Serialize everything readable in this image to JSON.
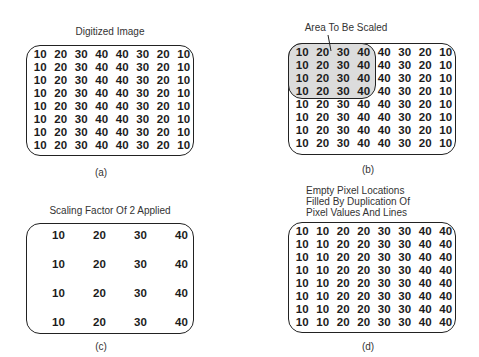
{
  "panels": {
    "a": {
      "title": "Digitized Image",
      "caption": "(a)",
      "grid": [
        [
          "10",
          "20",
          "30",
          "40",
          "40",
          "30",
          "20",
          "10"
        ],
        [
          "10",
          "20",
          "30",
          "40",
          "40",
          "30",
          "20",
          "10"
        ],
        [
          "10",
          "20",
          "30",
          "40",
          "40",
          "30",
          "20",
          "10"
        ],
        [
          "10",
          "20",
          "30",
          "40",
          "40",
          "30",
          "20",
          "10"
        ],
        [
          "10",
          "20",
          "30",
          "40",
          "40",
          "30",
          "20",
          "10"
        ],
        [
          "10",
          "20",
          "30",
          "40",
          "40",
          "30",
          "20",
          "10"
        ],
        [
          "10",
          "20",
          "30",
          "40",
          "40",
          "30",
          "20",
          "10"
        ],
        [
          "10",
          "20",
          "30",
          "40",
          "40",
          "30",
          "20",
          "10"
        ]
      ]
    },
    "b": {
      "title": "Area To Be Scaled",
      "caption": "(b)",
      "highlight": {
        "rows": 4,
        "cols": 4,
        "fill": "#dcdcdc"
      },
      "grid": [
        [
          "10",
          "20",
          "30",
          "40",
          "40",
          "30",
          "20",
          "10"
        ],
        [
          "10",
          "20",
          "30",
          "40",
          "40",
          "30",
          "20",
          "10"
        ],
        [
          "10",
          "20",
          "30",
          "40",
          "40",
          "30",
          "20",
          "10"
        ],
        [
          "10",
          "20",
          "30",
          "40",
          "40",
          "30",
          "20",
          "10"
        ],
        [
          "10",
          "20",
          "30",
          "40",
          "40",
          "30",
          "20",
          "10"
        ],
        [
          "10",
          "20",
          "30",
          "40",
          "40",
          "30",
          "20",
          "10"
        ],
        [
          "10",
          "20",
          "30",
          "40",
          "40",
          "30",
          "20",
          "10"
        ],
        [
          "10",
          "20",
          "30",
          "40",
          "40",
          "30",
          "20",
          "10"
        ]
      ]
    },
    "c": {
      "title": "Scaling Factor Of 2 Applied",
      "caption": "(c)",
      "grid": [
        [
          "10",
          "20",
          "30",
          "40"
        ],
        [
          "10",
          "20",
          "30",
          "40"
        ],
        [
          "10",
          "20",
          "30",
          "40"
        ],
        [
          "10",
          "20",
          "30",
          "40"
        ]
      ]
    },
    "d": {
      "title_lines": [
        "Empty Pixel Locations",
        "Filled By Duplication Of",
        "Pixel Values And Lines"
      ],
      "caption": "(d)",
      "grid": [
        [
          "10",
          "10",
          "20",
          "20",
          "30",
          "30",
          "40",
          "40"
        ],
        [
          "10",
          "10",
          "20",
          "20",
          "30",
          "30",
          "40",
          "40"
        ],
        [
          "10",
          "10",
          "20",
          "20",
          "30",
          "30",
          "40",
          "40"
        ],
        [
          "10",
          "10",
          "20",
          "20",
          "30",
          "30",
          "40",
          "40"
        ],
        [
          "10",
          "10",
          "20",
          "20",
          "30",
          "30",
          "40",
          "40"
        ],
        [
          "10",
          "10",
          "20",
          "20",
          "30",
          "30",
          "40",
          "40"
        ],
        [
          "10",
          "10",
          "20",
          "20",
          "30",
          "30",
          "40",
          "40"
        ],
        [
          "10",
          "10",
          "20",
          "20",
          "30",
          "30",
          "40",
          "40"
        ]
      ]
    }
  }
}
